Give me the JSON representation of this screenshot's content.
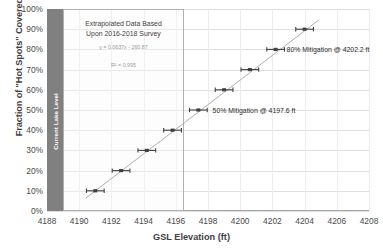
{
  "chart_data": {
    "type": "scatter",
    "title": "",
    "xlabel": "GSL Elevation (ft)",
    "ylabel": "Fraction of \"Hot Spots\" Covered by Water",
    "xlim": [
      4188,
      4208
    ],
    "ylim": [
      0,
      1
    ],
    "xticks": [
      "4188",
      "4190",
      "4192",
      "4194",
      "4196",
      "4198",
      "4200",
      "4202",
      "4204",
      "4206",
      "4208"
    ],
    "xtick_values": [
      4188,
      4190,
      4192,
      4194,
      4196,
      4198,
      4200,
      4202,
      4204,
      4206,
      4208
    ],
    "yticks": [
      "0%",
      "10%",
      "20%",
      "30%",
      "40%",
      "50%",
      "60%",
      "70%",
      "80%",
      "90%",
      "100%"
    ],
    "ytick_values": [
      0,
      0.1,
      0.2,
      0.3,
      0.4,
      0.5,
      0.6,
      0.7,
      0.8,
      0.9,
      1.0
    ],
    "grid": true,
    "legend": "none",
    "series": [
      {
        "name": "Hot Spot Coverage",
        "marker": "horizontal-error-bar",
        "color": "#404040",
        "x": [
          4191.0,
          4192.6,
          4194.2,
          4195.8,
          4197.4,
          4199.0,
          4200.6,
          4202.2,
          4204.0
        ],
        "y": [
          0.1,
          0.2,
          0.3,
          0.4,
          0.5,
          0.6,
          0.7,
          0.8,
          0.9
        ],
        "xerr": [
          0.55,
          0.55,
          0.55,
          0.55,
          0.55,
          0.55,
          0.55,
          0.55,
          0.55
        ]
      },
      {
        "name": "Linear Trendline",
        "type": "line",
        "color": "#a6a6a6",
        "x": [
          4190.4,
          4204.9
        ],
        "y": [
          0.063,
          0.947
        ]
      }
    ],
    "trendline": {
      "equation": "y = 0.0637x - 260.87",
      "r_squared": "R² = 0.995",
      "slope": 0.0637,
      "intercept": -260.87
    },
    "annotations": [
      {
        "name": "extrapolated-note",
        "line1": "Extrapolated Data Based",
        "line2": "Upon 2016-2018 Survey",
        "region_x_start": 4189.0,
        "region_x_end": 4196.5
      },
      {
        "name": "mitigation-50",
        "text": "50% Mitigation @ 4197.6 ft",
        "x": 4197.6,
        "y": 0.5
      },
      {
        "name": "mitigation-80",
        "text": "80% Mitigation @ 4202.2 ft",
        "x": 4202.2,
        "y": 0.8
      },
      {
        "name": "current-lake-level",
        "text": "Current Lake Level",
        "x_start": 4188.0,
        "x_end": 4189.0,
        "color": "#808080"
      }
    ],
    "colors": {
      "marker": "#404040",
      "trendline": "#a6a6a6",
      "grid": "#e0e0e0",
      "axis": "#a6a6a6",
      "band": "#808080",
      "text": "#3f3f3f",
      "muted_text": "#9a9a9a"
    }
  }
}
